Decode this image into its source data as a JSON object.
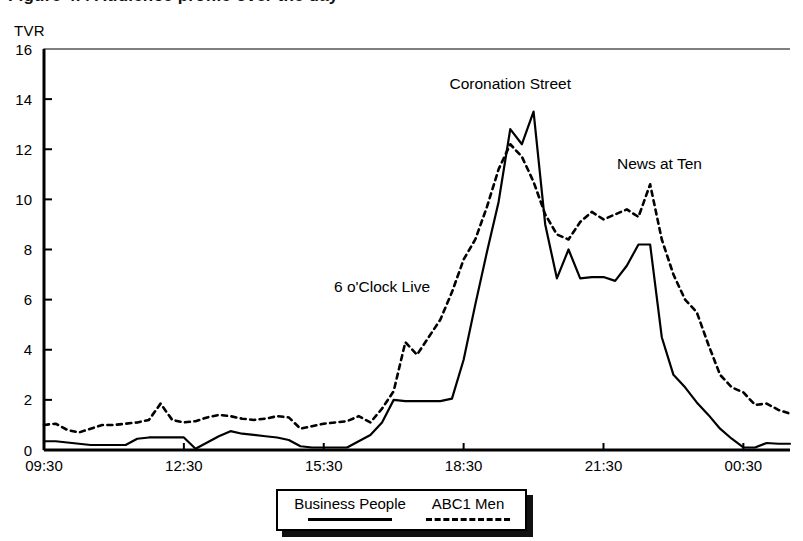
{
  "page": {
    "cut_title": "Figure 4.4 Audience profile over the day",
    "axis_unit": "TVR"
  },
  "legend": {
    "items": [
      {
        "label": "Business People",
        "style": "solid"
      },
      {
        "label": "ABC1 Men",
        "style": "dashed"
      }
    ]
  },
  "chart_data": {
    "type": "line",
    "title": "",
    "subtitle": "",
    "xlabel": "",
    "ylabel": "TVR",
    "ylim": [
      0,
      16
    ],
    "xlim": [
      9.5,
      25.5
    ],
    "ytick_labels": [
      "0",
      "2",
      "4",
      "6",
      "8",
      "10",
      "12",
      "14",
      "16"
    ],
    "ytick_values": [
      0,
      2,
      4,
      6,
      8,
      10,
      12,
      14,
      16
    ],
    "xtick_labels": [
      "09:30",
      "12:30",
      "15:30",
      "18:30",
      "21:30",
      "00:30"
    ],
    "xtick_values": [
      9.5,
      12.5,
      15.5,
      18.5,
      21.5,
      24.5
    ],
    "grid": false,
    "legend_position": "bottom",
    "annotations": [
      {
        "text": "6 o'Clock Live",
        "x": 16.75,
        "y": 6.3
      },
      {
        "text": "Coronation Street",
        "x": 19.5,
        "y": 14.4
      },
      {
        "text": "News at Ten",
        "x": 22.7,
        "y": 11.2
      }
    ],
    "x": [
      9.5,
      9.75,
      10.0,
      10.25,
      10.5,
      10.75,
      11.0,
      11.25,
      11.5,
      11.75,
      12.0,
      12.25,
      12.5,
      12.75,
      13.0,
      13.25,
      13.5,
      13.75,
      14.0,
      14.25,
      14.5,
      14.75,
      15.0,
      15.25,
      15.5,
      15.75,
      16.0,
      16.25,
      16.5,
      16.75,
      17.0,
      17.25,
      17.5,
      17.75,
      18.0,
      18.25,
      18.5,
      18.75,
      19.0,
      19.25,
      19.5,
      19.75,
      20.0,
      20.25,
      20.5,
      20.75,
      21.0,
      21.25,
      21.5,
      21.75,
      22.0,
      22.25,
      22.5,
      22.75,
      23.0,
      23.25,
      23.5,
      23.75,
      24.0,
      24.25,
      24.5,
      24.75,
      25.0,
      25.25,
      25.5
    ],
    "series": [
      {
        "name": "Business People",
        "style": "solid",
        "values": [
          0.35,
          0.35,
          0.3,
          0.25,
          0.2,
          0.2,
          0.2,
          0.2,
          0.45,
          0.5,
          0.5,
          0.5,
          0.5,
          0.05,
          0.3,
          0.55,
          0.75,
          0.65,
          0.6,
          0.55,
          0.5,
          0.4,
          0.15,
          0.1,
          0.1,
          0.1,
          0.1,
          0.35,
          0.6,
          1.1,
          2.0,
          1.95,
          1.95,
          1.95,
          1.95,
          2.05,
          3.6,
          5.8,
          7.9,
          9.9,
          12.8,
          12.2,
          13.5,
          9.0,
          6.85,
          8.0,
          6.85,
          6.9,
          6.9,
          6.75,
          7.35,
          8.2,
          8.2,
          4.5,
          3.0,
          2.5,
          1.9,
          1.4,
          0.85,
          0.45,
          0.1,
          0.1,
          0.28,
          0.25,
          0.25
        ]
      },
      {
        "name": "ABC1 Men",
        "style": "dashed",
        "values": [
          1.0,
          1.05,
          0.8,
          0.7,
          0.85,
          1.0,
          1.0,
          1.05,
          1.1,
          1.2,
          1.85,
          1.2,
          1.1,
          1.15,
          1.3,
          1.4,
          1.35,
          1.25,
          1.2,
          1.25,
          1.35,
          1.3,
          0.85,
          0.95,
          1.05,
          1.1,
          1.15,
          1.35,
          1.1,
          1.65,
          2.35,
          4.3,
          3.8,
          4.5,
          5.2,
          6.3,
          7.6,
          8.4,
          9.7,
          11.2,
          12.2,
          11.7,
          10.7,
          9.4,
          8.6,
          8.4,
          9.1,
          9.5,
          9.2,
          9.4,
          9.6,
          9.3,
          10.6,
          8.4,
          7.0,
          6.0,
          5.5,
          4.2,
          3.0,
          2.5,
          2.3,
          1.8,
          1.85,
          1.6,
          1.45
        ]
      }
    ]
  }
}
